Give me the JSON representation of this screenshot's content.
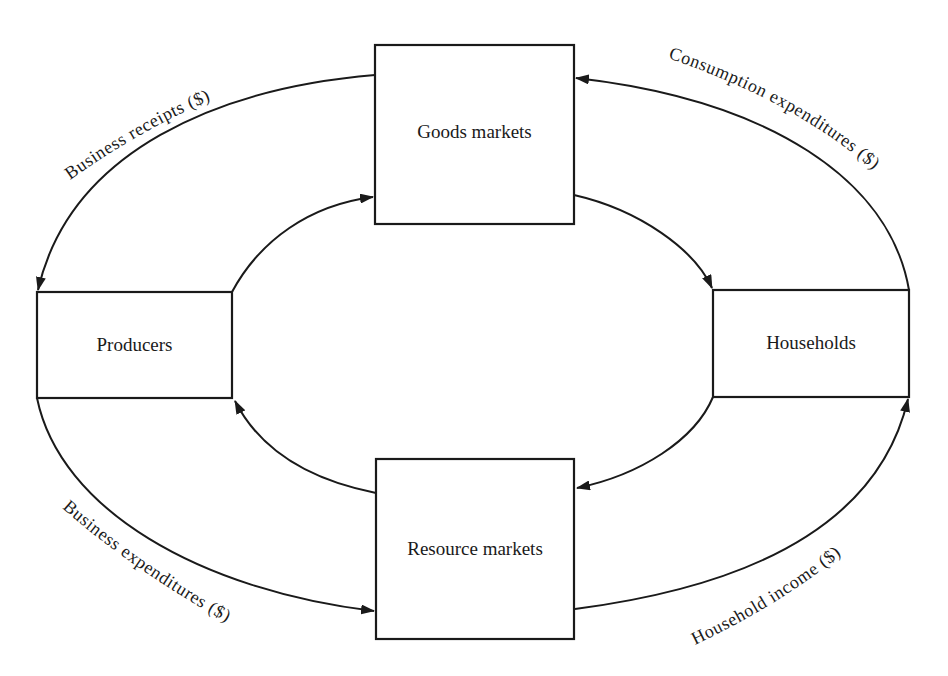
{
  "diagram": {
    "type": "circular-flow",
    "colors": {
      "stroke": "#1a1a1a",
      "background": "#ffffff"
    },
    "nodes": {
      "goods_markets": {
        "label": "Goods markets"
      },
      "producers": {
        "label": "Producers"
      },
      "households": {
        "label": "Households"
      },
      "resource_markets": {
        "label": "Resource markets"
      }
    },
    "flows": {
      "business_receipts": {
        "label": "Business receipts ($)",
        "from": "Goods markets",
        "to": "Producers"
      },
      "consumption_expenditures": {
        "label": "Consumption expenditures ($)",
        "from": "Households",
        "to": "Goods markets"
      },
      "business_expenditures": {
        "label": "Business expenditures ($)",
        "from": "Producers",
        "to": "Resource markets"
      },
      "household_income": {
        "label": "Household income ($)",
        "from": "Resource markets",
        "to": "Households"
      },
      "inner_producers_to_goods": {
        "from": "Producers",
        "to": "Goods markets"
      },
      "inner_goods_to_households": {
        "from": "Goods markets",
        "to": "Households"
      },
      "inner_households_to_resource": {
        "from": "Households",
        "to": "Resource markets"
      },
      "inner_resource_to_producers": {
        "from": "Resource markets",
        "to": "Producers"
      }
    }
  }
}
